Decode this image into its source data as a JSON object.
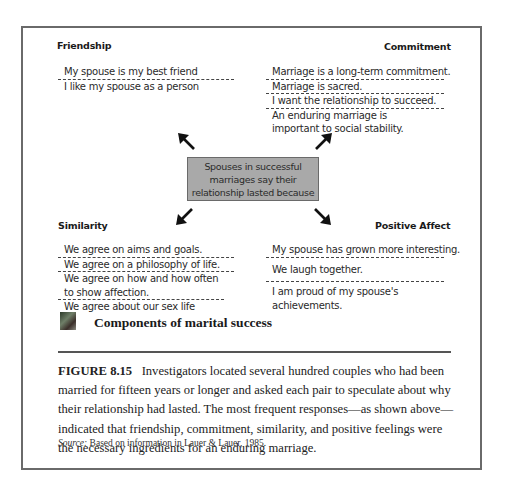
{
  "diagram": {
    "center": {
      "lines": [
        "Spouses in successful",
        "marriages say their",
        "relationship lasted because"
      ]
    },
    "quadrants": {
      "friendship": {
        "heading": "Friendship",
        "items": [
          "My spouse is my best friend",
          "I like my spouse as a person"
        ]
      },
      "commitment": {
        "heading": "Commitment",
        "items": [
          "Marriage is a long-term commitment.",
          "Marriage is sacred.",
          "I want the relationship to succeed.",
          "An enduring marriage is important to social stability."
        ]
      },
      "similarity": {
        "heading": "Similarity",
        "items": [
          "We agree on aims and goals.",
          "We agree on a philosophy of life.",
          "We agree on how and how often to show affection.",
          "We agree about our sex life"
        ]
      },
      "positive_affect": {
        "heading": "Positive Affect",
        "items": [
          "My spouse has grown more interesting.",
          "We laugh together.",
          "I am proud of my spouse's achievements."
        ]
      }
    },
    "arrows": [
      "up-left",
      "up-right",
      "down-left",
      "down-right"
    ],
    "colors": {
      "center_fill": "#a9a9a9",
      "frame": "#6a6a6a",
      "arrow": "#111111"
    }
  },
  "figure": {
    "icon": "photo-thumbnail-icon",
    "title": "Components of marital success",
    "label": "FIGURE 8.15",
    "caption": "Investigators located several hundred couples who had been married for fifteen years or longer and asked each pair to speculate about why their relationship had lasted. The most frequent responses—as shown above—indicated that friendship, commitment, similarity, and positive feelings were the necessary ingredients for an enduring marriage.",
    "source_label": "Source:",
    "source_text": "Based on information in Lauer & Lauer, 1985."
  }
}
